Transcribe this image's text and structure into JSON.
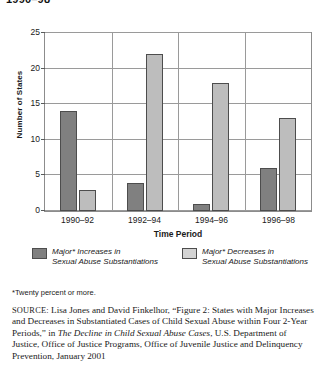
{
  "top_title": "1990–98",
  "chart_data": {
    "type": "bar",
    "title": "",
    "xlabel": "Time Period",
    "ylabel": "Number of States",
    "categories": [
      "1990–92",
      "1992–94",
      "1994–96",
      "1996–98"
    ],
    "series": [
      {
        "name": "Major* Increases in Sexual Abuse Substantiations",
        "color": "#808080",
        "values": [
          14,
          4,
          1,
          6
        ]
      },
      {
        "name": "Major* Decreases in Sexual Abuse Substantiations",
        "color": "#bdbdbd",
        "values": [
          3,
          22,
          18,
          13
        ]
      }
    ],
    "ylim": [
      0,
      25
    ],
    "yticks": [
      0,
      5,
      10,
      15,
      20,
      25
    ],
    "grid": true,
    "legend_position": "bottom"
  },
  "legend": {
    "items": [
      {
        "line1": "Major* Increases in",
        "line2": "Sexual Abuse Substantiations",
        "swatch": "dark-gray-swatch"
      },
      {
        "line1": "Major* Decreases in",
        "line2": "Sexual Abuse Substantiations",
        "swatch": "light-gray-swatch"
      }
    ]
  },
  "footnote": "*Twenty percent or more.",
  "source": {
    "prefix": "SOURCE:",
    "part1": " Lisa Jones and David Finkelhor, “Figure 2: States with Major Increases and Decreases in Substantiated Cases of Child Sexual Abuse within Four 2-Year Periods,” in ",
    "italic_title": "The Decline in Child Sexual Abuse Cases",
    "part2": ", U.S. Department of Justice, Office of Justice Programs, Office of Juvenile Justice and Delinquency Prevention, January 2001"
  }
}
